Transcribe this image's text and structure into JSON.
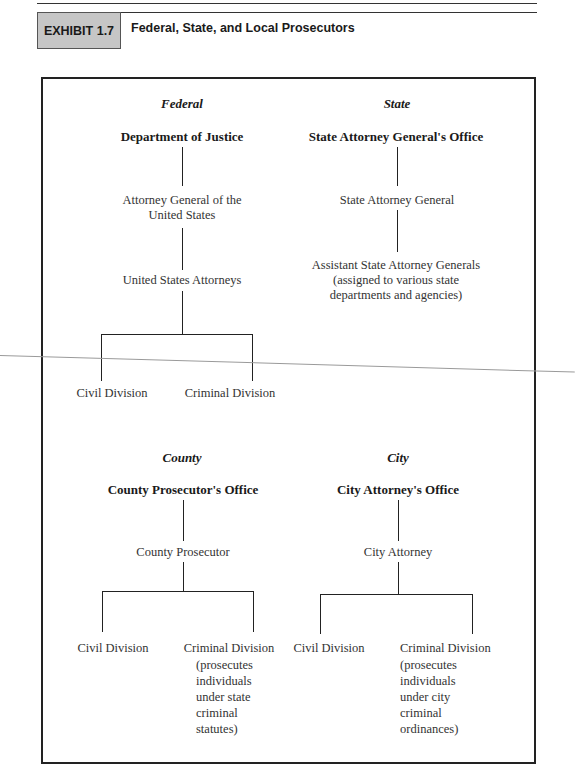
{
  "header": {
    "exhibit_label": "EXHIBIT 1.7",
    "title": "Federal, State, and Local Prosecutors"
  },
  "diagram": {
    "federal": {
      "category": "Federal",
      "office": "Department of Justice",
      "level1": [
        "Attorney General of the",
        "United States"
      ],
      "level2": "United States Attorneys",
      "children": [
        {
          "label": "Civil Division"
        },
        {
          "label": "Criminal Division"
        }
      ]
    },
    "state": {
      "category": "State",
      "office": "State Attorney General's Office",
      "level1": "State Attorney General",
      "level2": [
        "Assistant State Attorney Generals",
        "(assigned to various state",
        "departments and agencies)"
      ]
    },
    "county": {
      "category": "County",
      "office": "County Prosecutor's Office",
      "level1": "County Prosecutor",
      "children": [
        {
          "label": "Civil Division"
        },
        {
          "label": "Criminal Division",
          "notes": [
            "(prosecutes",
            "individuals",
            "under state",
            "criminal",
            "statutes)"
          ]
        }
      ]
    },
    "city": {
      "category": "City",
      "office": "City Attorney's Office",
      "level1": "City Attorney",
      "children": [
        {
          "label": "Civil Division"
        },
        {
          "label": "Criminal Division",
          "notes": [
            "(prosecutes",
            "individuals",
            "under city",
            "criminal",
            "ordinances)"
          ]
        }
      ]
    }
  }
}
